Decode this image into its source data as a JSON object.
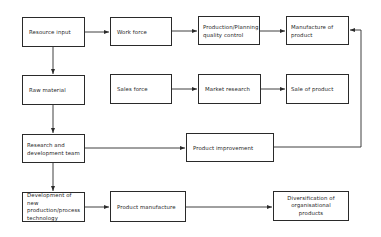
{
  "diagram": {
    "type": "flowchart",
    "line_color": "#2a2a2a",
    "nodes": [
      {
        "id": "resource_input",
        "label": "Resource input"
      },
      {
        "id": "work_force",
        "label": "Work force"
      },
      {
        "id": "production_planning",
        "label": "Production/Planning\nquality control"
      },
      {
        "id": "manufacture_of_product",
        "label": "Manufacture of\nproduct"
      },
      {
        "id": "raw_material",
        "label": "Raw material"
      },
      {
        "id": "sales_force",
        "label": "Sales force"
      },
      {
        "id": "market_research",
        "label": "Market research"
      },
      {
        "id": "sale_of_product",
        "label": "Sale of product"
      },
      {
        "id": "research_development",
        "label": "Research and\ndevelopment team"
      },
      {
        "id": "product_improvement",
        "label": "Product improvement"
      },
      {
        "id": "development_new_tech",
        "label": "Development of new\nproduction/process\ntechnology"
      },
      {
        "id": "product_manufacture",
        "label": "Product manufacture"
      },
      {
        "id": "diversification",
        "label": "Diversification of\norganisational\nproducts"
      }
    ],
    "edges": [
      {
        "from": "resource_input",
        "to": "work_force"
      },
      {
        "from": "work_force",
        "to": "production_planning"
      },
      {
        "from": "production_planning",
        "to": "manufacture_of_product"
      },
      {
        "from": "resource_input",
        "to": "raw_material"
      },
      {
        "from": "sales_force",
        "to": "market_research"
      },
      {
        "from": "market_research",
        "to": "sale_of_product"
      },
      {
        "from": "raw_material",
        "to": "research_development"
      },
      {
        "from": "research_development",
        "to": "product_improvement"
      },
      {
        "from": "product_improvement",
        "to": "manufacture_of_product"
      },
      {
        "from": "research_development",
        "to": "development_new_tech"
      },
      {
        "from": "development_new_tech",
        "to": "product_manufacture"
      },
      {
        "from": "product_manufacture",
        "to": "diversification"
      }
    ]
  }
}
